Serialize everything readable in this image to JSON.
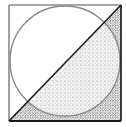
{
  "diagram": {
    "square": {
      "x": 9,
      "y": 5,
      "size": 112,
      "stroke_light": "#8a8a8a",
      "stroke_dark": "#1a1a1a"
    },
    "circle": {
      "cx": 65,
      "cy": 61,
      "r": 55,
      "stroke": "#8a8a8a"
    },
    "diagonal": {
      "from": [
        9,
        121
      ],
      "to": [
        121,
        5
      ],
      "stroke": "#1a1a1a"
    },
    "shaded_region": {
      "shape": "triangle",
      "vertices": [
        [
          9,
          121
        ],
        [
          121,
          5
        ],
        [
          121,
          121
        ]
      ],
      "fill": "stipple",
      "dot_color": "#333333"
    }
  }
}
